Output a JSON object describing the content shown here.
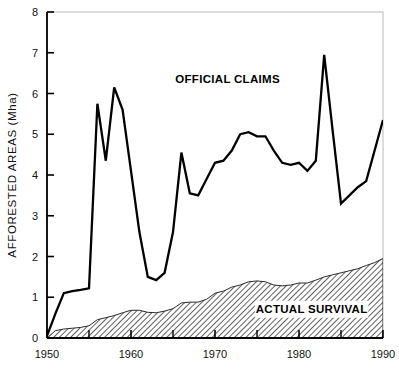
{
  "chart_data": {
    "type": "line",
    "title": "",
    "xlabel": "",
    "ylabel": "AFFORESTED AREAS (Mha)",
    "xlim": [
      1950,
      1990
    ],
    "ylim": [
      0,
      8
    ],
    "grid": false,
    "legend_position": "inline-annotations",
    "x_ticks_major": [
      1950,
      1960,
      1970,
      1980,
      1990
    ],
    "x_ticks_major_labels": [
      "1950",
      "1960",
      "1970",
      "1980",
      "1990"
    ],
    "x_ticks_minor": [
      1955,
      1965,
      1975,
      1985
    ],
    "y_ticks": [
      0,
      1,
      2,
      3,
      4,
      5,
      6,
      7,
      8
    ],
    "y_tick_labels": [
      "0",
      "1",
      "2",
      "3",
      "4",
      "5",
      "6",
      "7",
      "8"
    ],
    "annotations": [
      {
        "text": "OFFICIAL CLAIMS",
        "x": 1971.5,
        "y": 6.25
      },
      {
        "text": "ACTUAL SURVIVAL",
        "x": 1981.5,
        "y": 0.62
      }
    ],
    "series": [
      {
        "name": "OFFICIAL CLAIMS",
        "style": "line",
        "color": "#000000",
        "x": [
          1950,
          1951,
          1952,
          1953,
          1954,
          1955,
          1956,
          1957,
          1958,
          1959,
          1960,
          1961,
          1962,
          1963,
          1964,
          1965,
          1966,
          1967,
          1968,
          1969,
          1970,
          1971,
          1972,
          1973,
          1974,
          1975,
          1976,
          1977,
          1978,
          1979,
          1980,
          1981,
          1982,
          1983,
          1984,
          1985,
          1986,
          1987,
          1988,
          1989,
          1990
        ],
        "values": [
          0.05,
          0.6,
          1.1,
          1.15,
          1.18,
          1.22,
          5.75,
          4.35,
          6.15,
          5.6,
          4.1,
          2.6,
          1.5,
          1.42,
          1.6,
          2.6,
          4.55,
          3.55,
          3.5,
          3.9,
          4.3,
          4.35,
          4.6,
          5.0,
          5.05,
          4.95,
          4.95,
          4.6,
          4.3,
          4.25,
          4.3,
          4.1,
          4.35,
          6.95,
          5.1,
          3.3,
          3.5,
          3.7,
          3.85,
          4.6,
          5.35
        ]
      },
      {
        "name": "ACTUAL SURVIVAL",
        "style": "area-hatched",
        "color": "#000000",
        "fill": "diagonal-hatch",
        "x": [
          1950,
          1951,
          1952,
          1953,
          1954,
          1955,
          1956,
          1957,
          1958,
          1959,
          1960,
          1961,
          1962,
          1963,
          1964,
          1965,
          1966,
          1967,
          1968,
          1969,
          1970,
          1971,
          1972,
          1973,
          1974,
          1975,
          1976,
          1977,
          1978,
          1979,
          1980,
          1981,
          1982,
          1983,
          1984,
          1985,
          1986,
          1987,
          1988,
          1989,
          1990
        ],
        "values": [
          0.0,
          0.18,
          0.22,
          0.24,
          0.26,
          0.3,
          0.45,
          0.5,
          0.55,
          0.62,
          0.68,
          0.68,
          0.63,
          0.62,
          0.66,
          0.72,
          0.86,
          0.88,
          0.88,
          0.95,
          1.1,
          1.15,
          1.25,
          1.3,
          1.38,
          1.4,
          1.38,
          1.3,
          1.28,
          1.3,
          1.35,
          1.35,
          1.42,
          1.5,
          1.55,
          1.6,
          1.65,
          1.7,
          1.78,
          1.85,
          1.95
        ]
      }
    ]
  },
  "axes": {
    "y_axis_title": "AFFORESTED AREAS (Mha)"
  }
}
